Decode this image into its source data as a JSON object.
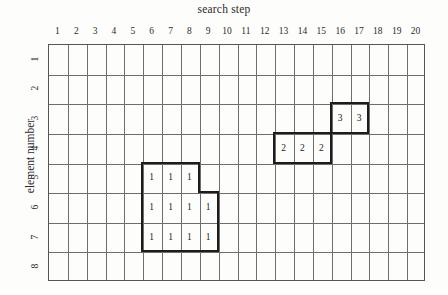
{
  "figure": {
    "x_axis_title": "search step",
    "y_axis_title": "element number"
  },
  "chart_data": {
    "type": "heatmap",
    "title": "",
    "xlabel": "search step",
    "ylabel": "element number",
    "grid": true,
    "legend": "none",
    "x_ticks": [
      "1",
      "2",
      "3",
      "4",
      "5",
      "6",
      "7",
      "8",
      "9",
      "10",
      "11",
      "12",
      "13",
      "14",
      "15",
      "16",
      "17",
      "18",
      "19",
      "20"
    ],
    "y_ticks": [
      "1",
      "2",
      "3",
      "4",
      "5",
      "6",
      "7",
      "8"
    ],
    "xlim": [
      1,
      20
    ],
    "ylim": [
      1,
      8
    ],
    "cells": [
      {
        "row": 5,
        "col": 6,
        "value": "1"
      },
      {
        "row": 5,
        "col": 7,
        "value": "1"
      },
      {
        "row": 5,
        "col": 8,
        "value": "1"
      },
      {
        "row": 6,
        "col": 6,
        "value": "1"
      },
      {
        "row": 6,
        "col": 7,
        "value": "1"
      },
      {
        "row": 6,
        "col": 8,
        "value": "1"
      },
      {
        "row": 6,
        "col": 9,
        "value": "1"
      },
      {
        "row": 7,
        "col": 6,
        "value": "1"
      },
      {
        "row": 7,
        "col": 7,
        "value": "1"
      },
      {
        "row": 7,
        "col": 8,
        "value": "1"
      },
      {
        "row": 7,
        "col": 9,
        "value": "1"
      },
      {
        "row": 4,
        "col": 13,
        "value": "2"
      },
      {
        "row": 4,
        "col": 14,
        "value": "2"
      },
      {
        "row": 4,
        "col": 15,
        "value": "2"
      },
      {
        "row": 3,
        "col": 16,
        "value": "3"
      },
      {
        "row": 3,
        "col": 17,
        "value": "3"
      }
    ],
    "blocks": [
      {
        "label": "1",
        "cells": [
          [
            5,
            6
          ],
          [
            5,
            7
          ],
          [
            5,
            8
          ],
          [
            6,
            6
          ],
          [
            6,
            7
          ],
          [
            6,
            8
          ],
          [
            6,
            9
          ],
          [
            7,
            6
          ],
          [
            7,
            7
          ],
          [
            7,
            8
          ],
          [
            7,
            9
          ]
        ]
      },
      {
        "label": "2",
        "cells": [
          [
            4,
            13
          ],
          [
            4,
            14
          ],
          [
            4,
            15
          ]
        ]
      },
      {
        "label": "3",
        "cells": [
          [
            3,
            16
          ],
          [
            3,
            17
          ]
        ]
      }
    ]
  }
}
